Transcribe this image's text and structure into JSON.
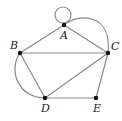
{
  "graph": {
    "nodes": [
      {
        "id": "A",
        "label": "A",
        "x": 64,
        "y": 25
      },
      {
        "id": "B",
        "label": "B",
        "x": 20,
        "y": 53
      },
      {
        "id": "C",
        "label": "C",
        "x": 108,
        "y": 53
      },
      {
        "id": "D",
        "label": "D",
        "x": 45,
        "y": 98
      },
      {
        "id": "E",
        "label": "E",
        "x": 96,
        "y": 98
      }
    ],
    "edges": [
      {
        "from": "A",
        "to": "A",
        "type": "loop"
      },
      {
        "from": "A",
        "to": "B",
        "type": "straight"
      },
      {
        "from": "A",
        "to": "C",
        "type": "straight"
      },
      {
        "from": "A",
        "to": "C",
        "type": "curved"
      },
      {
        "from": "B",
        "to": "C",
        "type": "straight"
      },
      {
        "from": "B",
        "to": "D",
        "type": "straight"
      },
      {
        "from": "B",
        "to": "D",
        "type": "curved"
      },
      {
        "from": "C",
        "to": "D",
        "type": "straight"
      },
      {
        "from": "C",
        "to": "E",
        "type": "straight"
      },
      {
        "from": "D",
        "to": "E",
        "type": "straight"
      }
    ],
    "colors": {
      "edge": "#8a8a8a",
      "node": "#111111",
      "label": "#222222"
    }
  }
}
